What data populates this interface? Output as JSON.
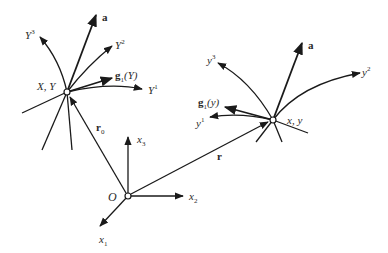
{
  "diagram": {
    "colors": {
      "stroke": "#1a1a1a",
      "text": "#2a2a2a",
      "background": "#ffffff"
    },
    "origin": {
      "label": "O",
      "axes": [
        {
          "name": "x",
          "index": "1"
        },
        {
          "name": "x",
          "index": "2"
        },
        {
          "name": "x",
          "index": "3"
        }
      ]
    },
    "left_frame": {
      "point_label": "X, Y",
      "position_vector": {
        "name": "r",
        "index": "0"
      },
      "vector_a": "a",
      "base_vector": {
        "name": "g",
        "index": "1",
        "arg": "(Y)"
      },
      "curves": [
        {
          "name": "Y",
          "index": "1"
        },
        {
          "name": "Y",
          "index": "2"
        },
        {
          "name": "Y",
          "index": "3"
        }
      ]
    },
    "right_frame": {
      "point_label": "x, y",
      "position_vector": {
        "name": "r"
      },
      "vector_a": "a",
      "base_vector": {
        "name": "g",
        "index": "1",
        "arg": "(y)"
      },
      "curves": [
        {
          "name": "y",
          "index": "1"
        },
        {
          "name": "y",
          "index": "2"
        },
        {
          "name": "y",
          "index": "3"
        }
      ]
    }
  }
}
